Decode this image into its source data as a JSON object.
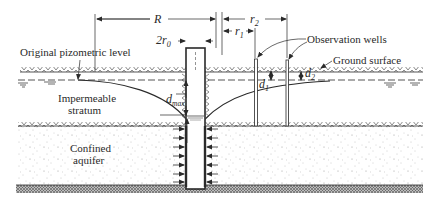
{
  "diagram": {
    "type": "confined-aquifer-well-drawdown",
    "labels": {
      "R": "R",
      "r2": "r",
      "r2_sub": "2",
      "r1": "r",
      "r1_sub": "1",
      "two_r0": "2r",
      "two_r0_sub": "0",
      "original_level": "Original pizometric level",
      "observation_wells": "Observation wells",
      "ground_surface": "Ground surface",
      "d1": "d",
      "d1_sub": "1",
      "d2": "d",
      "d2_sub": "2",
      "dmax": "d",
      "dmax_sub": "max",
      "impermeable_top_1": "Impermeable",
      "impermeable_top_2": "stratum",
      "confined_1": "Confined",
      "confined_2": "aquifer",
      "h0": "h",
      "h0_sub": "0",
      "h1": "h",
      "h1_sub": "1",
      "h2": "h",
      "h2_sub": "2",
      "H": "H",
      "S": "S",
      "impermeable_bottom": "Impermeable stratum"
    },
    "colors": {
      "ink": "#2a2a2a",
      "background": "#ffffff"
    }
  }
}
